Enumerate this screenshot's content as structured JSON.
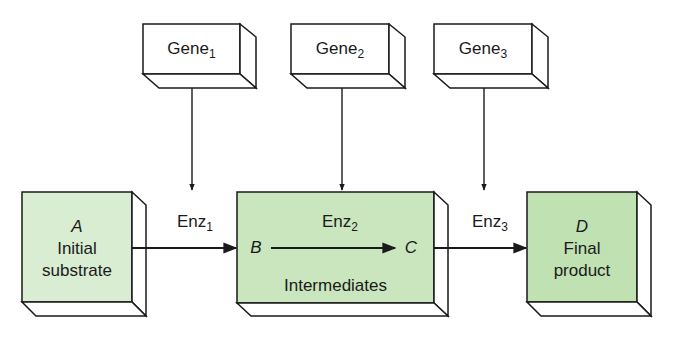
{
  "colors": {
    "stroke": "#1a1a1a",
    "gene_fill": "#ffffff",
    "substrate_fill": "#d9edd3",
    "intermediate_fill": "#c9e6be",
    "product_fill": "#c0e1b2",
    "side_fill": "#ffffff"
  },
  "genes": [
    {
      "base": "Gene",
      "sub": "1"
    },
    {
      "base": "Gene",
      "sub": "2"
    },
    {
      "base": "Gene",
      "sub": "3"
    }
  ],
  "enzymes": [
    {
      "base": "Enz",
      "sub": "1"
    },
    {
      "base": "Enz",
      "sub": "2"
    },
    {
      "base": "Enz",
      "sub": "3"
    }
  ],
  "substrate": {
    "letter": "A",
    "line1": "Initial",
    "line2": "substrate"
  },
  "intermediates": {
    "from": "B",
    "to": "C",
    "label": "Intermediates"
  },
  "product": {
    "letter": "D",
    "line1": "Final",
    "line2": "product"
  }
}
